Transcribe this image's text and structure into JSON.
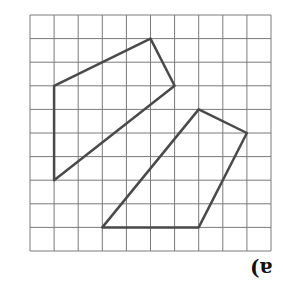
{
  "figure": {
    "label": "a)",
    "grid": {
      "cols": 10,
      "rows": 10,
      "left": 30,
      "top": 15,
      "cell_w": 24.1,
      "cell_h": 23.6,
      "line_color": "#7a7a7a",
      "line_width": 1
    },
    "shapes": [
      {
        "name": "quadrilateral-1",
        "vertices": [
          [
            5,
            1
          ],
          [
            6,
            3
          ],
          [
            1,
            7
          ],
          [
            1,
            3
          ]
        ],
        "stroke": "#4a4a4a",
        "width": 2.5
      },
      {
        "name": "quadrilateral-2",
        "vertices": [
          [
            7,
            4
          ],
          [
            9,
            5
          ],
          [
            7,
            9
          ],
          [
            3,
            9
          ]
        ],
        "stroke": "#4a4a4a",
        "width": 2.5
      }
    ]
  }
}
